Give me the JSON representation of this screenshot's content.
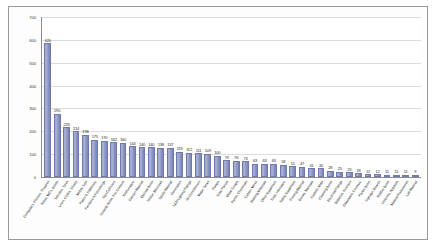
{
  "chart_data": {
    "type": "bar",
    "title": "",
    "xlabel": "",
    "ylabel": "",
    "ylim": [
      0,
      700
    ],
    "yticks": [
      0,
      100,
      200,
      300,
      400,
      500,
      600,
      700
    ],
    "grid": true,
    "legend": "none",
    "orientation": "vertical",
    "sort": "descending",
    "bar_color": "#9aa2cb",
    "bar_edge_color": "#6f79ab",
    "plot_background": "#ffffff",
    "gridline_color": "#dcdcdc",
    "axis_color": "#8d8d8d",
    "label_rotation_degrees": -56,
    "data_labels_shown": true,
    "categories": [
      "Computers, Phones, Theatres",
      "Toilets, WCs, Bidets",
      "Vehicles, Tyres",
      "Linen, Cloths, Sheets",
      "Mobile Sets",
      "Paper & Stationery",
      "Furniture & Furnishings",
      "Gas Cylinders",
      "Security Items, Fire Controls",
      "Kitchenware",
      "Garden Material",
      "Medical Items",
      "Timber, Windows",
      "Sports Material",
      "Generators",
      "LED Lighting Fittings",
      "Air Conditioners",
      "Water Tanks",
      "Pumps",
      "Solar Panels",
      "Metal Scraps",
      "Paints, Chemicals",
      "Cables, Wires",
      "Building Materials",
      "Office Equipment",
      "Tools, Hardware",
      "Safety Equipment",
      "Printing Material",
      "Books, Manuals",
      "Carpets, Mats",
      "Cleaning Items",
      "Electrical Fittings",
      "Batteries, Inverters",
      "Glassware, Crockery",
      "Plastic Items",
      "Signage, Boards",
      "Rubber Items",
      "Uniforms, Apparels",
      "Musical Instruments",
      "Lab Material"
    ],
    "values": [
      626,
      295,
      233,
      214,
      198,
      175,
      170,
      162,
      160,
      144,
      140,
      140,
      138,
      137,
      119,
      112,
      111,
      109,
      100,
      79,
      76,
      73,
      63,
      63,
      63,
      58,
      51,
      47,
      41,
      40,
      28,
      25,
      23,
      18,
      12,
      12,
      11,
      11,
      11,
      9
    ]
  }
}
